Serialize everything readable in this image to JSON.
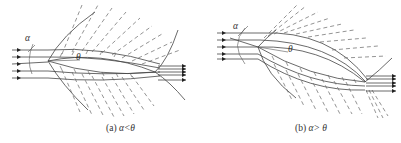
{
  "figure": {
    "panels": [
      {
        "id": "a",
        "caption_prefix": "(a) ",
        "caption_expr": "α<θ",
        "labels": {
          "alpha": "α",
          "theta": "θ"
        },
        "description": "Symmetric lens-shaped body at small incidence; oblique shock at leading edge, expansion fan along surfaces, trailing shock; incoming flow arrows from left, outgoing arrows at right"
      },
      {
        "id": "b",
        "caption_prefix": "(b) ",
        "caption_expr": "α> θ",
        "labels": {
          "alpha": "α",
          "theta": "θ"
        },
        "description": "Same body at incidence greater than half-angle; expansion on upper surface from leading edge, shock on lower surface; outgoing arrows at right"
      }
    ],
    "colors": {
      "line": "#444444",
      "dash": "#666666",
      "background": "#ffffff"
    }
  }
}
